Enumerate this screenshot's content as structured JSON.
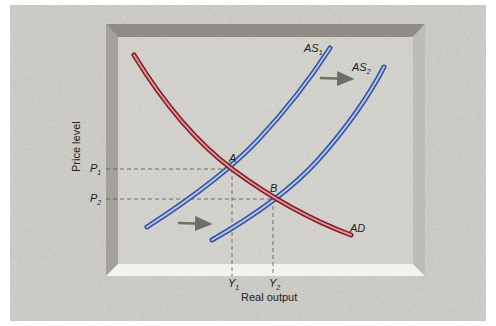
{
  "diagram": {
    "axes": {
      "y_label": "Price level",
      "x_label": "Real output"
    },
    "curves": [
      {
        "id": "AD",
        "label": "AD",
        "color": "#c8404a"
      },
      {
        "id": "AS1",
        "label": "AS",
        "subscript": "1",
        "color": "#4f74c8"
      },
      {
        "id": "AS2",
        "label": "AS",
        "subscript": "2",
        "color": "#4f74c8"
      }
    ],
    "points": [
      {
        "id": "A",
        "label": "A"
      },
      {
        "id": "B",
        "label": "B"
      }
    ],
    "price_ticks": [
      {
        "label": "P",
        "subscript": "1"
      },
      {
        "label": "P",
        "subscript": "2"
      }
    ],
    "output_ticks": [
      {
        "label": "Y",
        "subscript": "1"
      },
      {
        "label": "Y",
        "subscript": "2"
      }
    ],
    "shift_arrows": [
      "rightward-shift-arrow-top",
      "rightward-shift-arrow-bottom"
    ],
    "colors": {
      "background": "#c9c8c3",
      "panel": "#d2d1cc",
      "bevel_dark": "#8e8c85",
      "bevel_light": "#f2f2ef",
      "ad": "#c8404a",
      "as": "#4f74c8",
      "arrow": "#6f6e68"
    }
  }
}
